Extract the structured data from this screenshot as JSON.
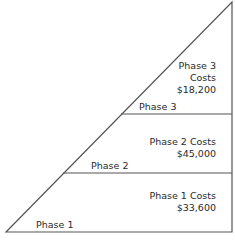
{
  "diagram": {
    "type": "triangle-cost-breakdown",
    "phases": [
      {
        "name": "Phase 1",
        "cost_label": "Phase 1 Costs",
        "cost": "$33,600"
      },
      {
        "name": "Phase 2",
        "cost_label": "Phase 2 Costs",
        "cost": "$45,000"
      },
      {
        "name": "Phase 3",
        "cost_label_line1": "Phase 3",
        "cost_label_line2": "Costs",
        "cost": "$18,200"
      }
    ]
  }
}
